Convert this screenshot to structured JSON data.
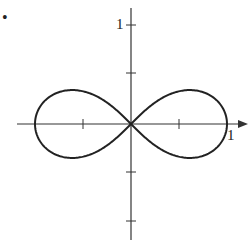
{
  "bullet": "•",
  "chart_data": {
    "type": "line",
    "title": "",
    "curve": "lemniscate r^2 = cos(2θ)",
    "xlabel": "",
    "ylabel": "",
    "x_tick_labels": [
      "1"
    ],
    "y_tick_labels": [
      "1"
    ],
    "xlim": [
      -1,
      1
    ],
    "ylim": [
      -1,
      1
    ],
    "grid": false,
    "ticks": {
      "x": [
        -0.5,
        0.5
      ],
      "y": [
        -1,
        -0.5,
        0.5,
        1
      ]
    }
  },
  "labels": {
    "x_one": "1",
    "y_one": "1"
  }
}
